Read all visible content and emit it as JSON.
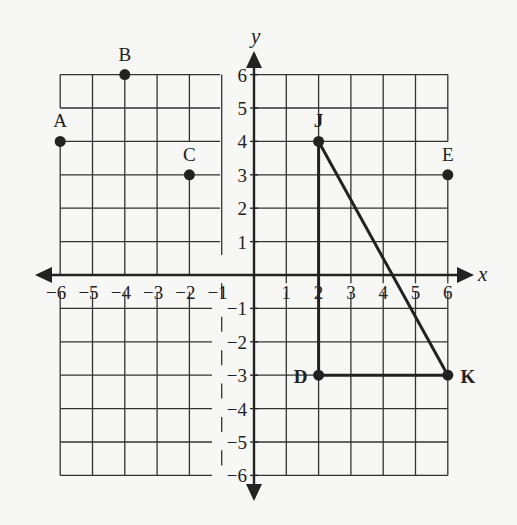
{
  "figure": {
    "type": "coordinate-plane",
    "background": "#f7f7f5",
    "ink_color": "#222222",
    "x_axis_label": "x",
    "y_axis_label": "y",
    "x_range": [
      -6,
      6
    ],
    "y_range": [
      -6,
      6
    ],
    "x_tick_labels": [
      "−6",
      "−5",
      "−4",
      "−3",
      "−2",
      "−1",
      "1",
      "2",
      "3",
      "4",
      "5",
      "6"
    ],
    "y_tick_labels": [
      "6",
      "5",
      "4",
      "3",
      "2",
      "1",
      "−1",
      "−2",
      "−3",
      "−4",
      "−5",
      "−6"
    ],
    "points": [
      {
        "label": "A",
        "x": -6,
        "y": 4,
        "bold": false
      },
      {
        "label": "B",
        "x": -4,
        "y": 6,
        "bold": false
      },
      {
        "label": "C",
        "x": -2,
        "y": 3,
        "bold": false
      },
      {
        "label": "E",
        "x": 6,
        "y": 3,
        "bold": false
      },
      {
        "label": "J",
        "x": 2,
        "y": 4,
        "bold": true
      },
      {
        "label": "D",
        "x": 2,
        "y": -3,
        "bold": true
      },
      {
        "label": "K",
        "x": 6,
        "y": -3,
        "bold": true
      }
    ],
    "segments": [
      {
        "from": "J",
        "to": "D"
      },
      {
        "from": "D",
        "to": "K"
      },
      {
        "from": "K",
        "to": "J"
      }
    ],
    "shape": "right triangle JDK"
  },
  "chart_data": {
    "type": "scatter",
    "title": "",
    "xlabel": "x",
    "ylabel": "y",
    "xlim": [
      -6,
      6
    ],
    "ylim": [
      -6,
      6
    ],
    "grid": true,
    "series": [
      {
        "name": "points",
        "x": [
          -6,
          -4,
          -2,
          6,
          2,
          2,
          6
        ],
        "y": [
          4,
          6,
          3,
          3,
          4,
          -3,
          -3
        ],
        "labels": [
          "A",
          "B",
          "C",
          "E",
          "J",
          "D",
          "K"
        ]
      },
      {
        "name": "triangle JDK",
        "x": [
          2,
          2,
          6,
          2
        ],
        "y": [
          4,
          -3,
          -3,
          4
        ]
      }
    ]
  }
}
